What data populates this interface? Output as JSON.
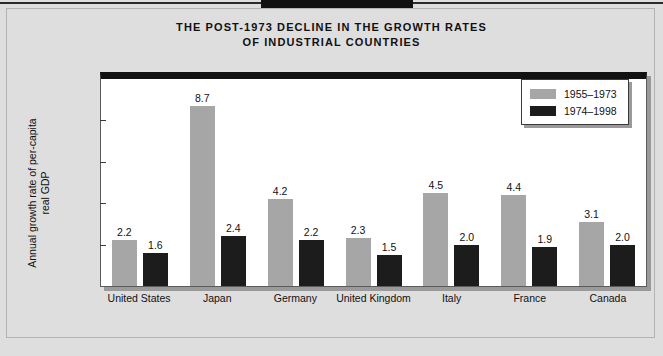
{
  "chart_data": {
    "type": "bar",
    "title": "THE POST-1973 DECLINE IN THE GROWTH RATES OF INDUSTRIAL COUNTRIES",
    "title_lines": [
      "THE POST-1973 DECLINE IN THE GROWTH RATES",
      "OF INDUSTRIAL COUNTRIES"
    ],
    "xlabel": "",
    "ylabel": "Annual growth rate of per-capita real GDP",
    "ylabel_lines": [
      "Annual growth rate of per-capita",
      "real GDP"
    ],
    "ylim": [
      0,
      10
    ],
    "yticks": [
      0,
      2,
      4,
      6,
      8,
      10
    ],
    "ytick_labels": [
      "0",
      "2",
      "4",
      "6",
      "8",
      "10"
    ],
    "grid": false,
    "legend_position": "top-right",
    "categories": [
      "United States",
      "Japan",
      "Germany",
      "United Kingdom",
      "Italy",
      "France",
      "Canada"
    ],
    "series": [
      {
        "name": "1955–1973",
        "color": "#a6a6a6",
        "values": [
          2.2,
          8.7,
          4.2,
          2.3,
          4.5,
          4.4,
          3.1
        ],
        "value_labels": [
          "2.2",
          "8.7",
          "4.2",
          "2.3",
          "4.5",
          "4.4",
          "3.1"
        ]
      },
      {
        "name": "1974–1998",
        "color": "#1c1c1c",
        "values": [
          1.6,
          2.4,
          2.2,
          1.5,
          2.0,
          1.9,
          2.0
        ],
        "value_labels": [
          "1.6",
          "2.4",
          "2.2",
          "1.5",
          "2.0",
          "1.9",
          "2.0"
        ]
      }
    ]
  },
  "legend": {
    "entries": [
      {
        "label": "1955–1973",
        "color": "#a6a6a6"
      },
      {
        "label": "1974–1998",
        "color": "#1c1c1c"
      }
    ]
  },
  "colors": {
    "page_background": "#dedede",
    "plot_background": "#ffffff",
    "series_1955_1973": "#a6a6a6",
    "series_1974_1998": "#1c1c1c",
    "axis": "#5a5a5a",
    "text": "#111111"
  }
}
